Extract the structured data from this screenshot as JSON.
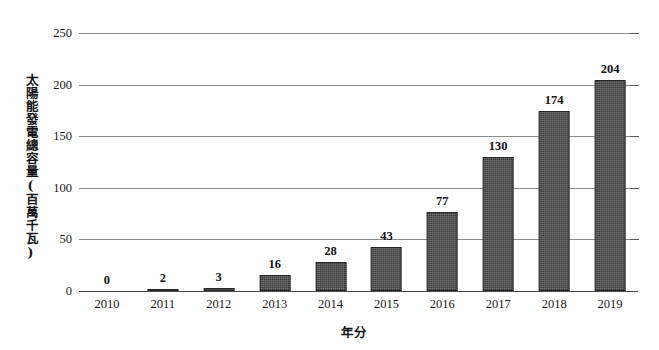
{
  "chart_data": {
    "type": "bar",
    "title": "",
    "xlabel": "年分",
    "ylabel": "太陽能發電總容量(百萬千瓦)",
    "categories": [
      "2010",
      "2011",
      "2012",
      "2013",
      "2014",
      "2015",
      "2016",
      "2017",
      "2018",
      "2019"
    ],
    "values": [
      0,
      2,
      3,
      16,
      28,
      43,
      77,
      130,
      174,
      204
    ],
    "value_labels": [
      "0",
      "2",
      "3",
      "16",
      "28",
      "43",
      "77",
      "130",
      "174",
      "204"
    ],
    "ylim": [
      0,
      250
    ],
    "yticks": [
      0,
      50,
      100,
      150,
      200,
      250
    ],
    "ytick_labels": [
      "0",
      "50",
      "100",
      "150",
      "200",
      "250"
    ],
    "grid": true,
    "legend": false,
    "series": [
      {
        "name": "太陽能發電總容量",
        "values": [
          0,
          2,
          3,
          16,
          28,
          43,
          77,
          130,
          174,
          204
        ],
        "color": "#3b3b3b"
      }
    ],
    "colors": {
      "bar_fill": "#3b3b3b",
      "gridline": "#8d8d8d",
      "axis": "#4a4a4a",
      "text": "#171717",
      "background": "#ffffff"
    }
  }
}
